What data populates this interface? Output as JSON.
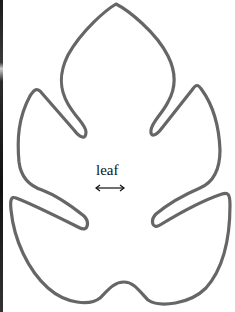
{
  "diagram": {
    "shape": "leaf-outline",
    "label": "leaf",
    "arrow": "double-headed-horizontal-arrow",
    "colors": {
      "outline": "#666666",
      "text": "#111111",
      "background": "#ffffff"
    }
  }
}
